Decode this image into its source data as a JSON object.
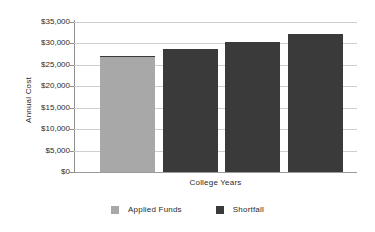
{
  "chart_data": {
    "type": "bar",
    "title": "",
    "subtitle": "",
    "xlabel": "College Years",
    "ylabel": "Annual Cost",
    "categories": [
      "1",
      "2",
      "3",
      "4"
    ],
    "stacked": true,
    "grid": true,
    "legend_position": "bottom",
    "ylim": [
      0,
      35000
    ],
    "ytick_values": [
      0,
      5000,
      10000,
      15000,
      20000,
      25000,
      30000,
      35000
    ],
    "ytick_labels": [
      "$0",
      "$5,000",
      "$10,000",
      "$15,000",
      "$20,000",
      "$25,000",
      "$30,000",
      "$35,000"
    ],
    "xtick_labels": [
      "",
      "",
      "",
      ""
    ],
    "series": [
      {
        "name": "Applied Funds",
        "color": "#a8a8a8",
        "values": [
          26800,
          0,
          0,
          0
        ]
      },
      {
        "name": "Shortfall",
        "color": "#3a3a3a",
        "values": [
          300,
          28800,
          30400,
          32200
        ]
      }
    ],
    "totals": [
      27100,
      28800,
      30400,
      32200
    ]
  },
  "axes": {
    "y_title": "Annual Cost",
    "x_title": "College Years"
  },
  "legend": {
    "items": [
      {
        "label": "Applied Funds",
        "color": "#a8a8a8"
      },
      {
        "label": "Shortfall",
        "color": "#3a3a3a"
      }
    ]
  },
  "style": {
    "gridline_color": "#cfcfcf",
    "axis_color": "#8f8f8f",
    "text_color": "#2b2b2b",
    "background": "#ffffff"
  }
}
